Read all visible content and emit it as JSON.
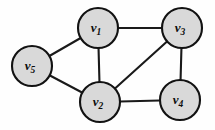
{
  "figure": {
    "background_color": "#fefefe",
    "width": 215,
    "height": 130
  },
  "style": {
    "node_fill": "#d9d9d9",
    "node_stroke": "#121212",
    "node_stroke_width": 2.1,
    "node_radius": 20,
    "edge_color": "#1a1a1a",
    "edge_width": 2.1,
    "label_color": "#0d0d0d"
  },
  "chart_data": {
    "type": "diagram",
    "subtype": "undirected-graph",
    "title": "",
    "xlabel": "",
    "ylabel": "",
    "grid": false,
    "legend": null,
    "node_count": 5,
    "edge_count": 7,
    "nodes": [
      {
        "id": "v1",
        "label": "v",
        "subscript": "1",
        "cx": 98,
        "cy": 28,
        "r": 20
      },
      {
        "id": "v2",
        "label": "v",
        "subscript": "2",
        "cx": 100,
        "cy": 102,
        "r": 20
      },
      {
        "id": "v3",
        "label": "v",
        "subscript": "3",
        "cx": 182,
        "cy": 28,
        "r": 20
      },
      {
        "id": "v4",
        "label": "v",
        "subscript": "4",
        "cx": 180,
        "cy": 100,
        "r": 20
      },
      {
        "id": "v5",
        "label": "v",
        "subscript": "5",
        "cx": 32,
        "cy": 66,
        "r": 20
      }
    ],
    "edges": [
      {
        "id": "e-v1-v3",
        "source": "v1",
        "target": "v3"
      },
      {
        "id": "e-v1-v2",
        "source": "v1",
        "target": "v2"
      },
      {
        "id": "e-v1-v5",
        "source": "v1",
        "target": "v5"
      },
      {
        "id": "e-v5-v2",
        "source": "v5",
        "target": "v2"
      },
      {
        "id": "e-v2-v3",
        "source": "v2",
        "target": "v3"
      },
      {
        "id": "e-v2-v4",
        "source": "v2",
        "target": "v4"
      },
      {
        "id": "e-v3-v4",
        "source": "v3",
        "target": "v4"
      }
    ],
    "adjacency": {
      "v1": [
        "v2",
        "v3",
        "v5"
      ],
      "v2": [
        "v1",
        "v3",
        "v4",
        "v5"
      ],
      "v3": [
        "v1",
        "v2",
        "v4"
      ],
      "v4": [
        "v2",
        "v3"
      ],
      "v5": [
        "v1",
        "v2"
      ]
    },
    "degrees": {
      "v1": 3,
      "v2": 4,
      "v3": 3,
      "v4": 2,
      "v5": 2
    }
  }
}
